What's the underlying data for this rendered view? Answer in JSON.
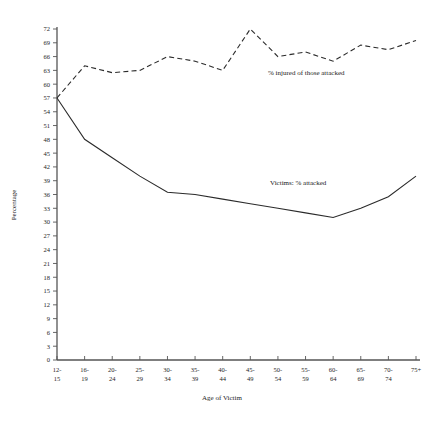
{
  "chart_data": {
    "type": "line",
    "title": "",
    "xlabel": "Age of Victim",
    "ylabel": "Percentage",
    "categories": [
      "12-\n15",
      "16-\n19",
      "20-\n24",
      "25-\n29",
      "30-\n34",
      "35-\n39",
      "40-\n44",
      "45-\n49",
      "50-\n54",
      "55-\n59",
      "60-\n64",
      "65-\n69",
      "70-\n74",
      "75+"
    ],
    "category_labels_top": [
      "12-",
      "16-",
      "20-",
      "25-",
      "30-",
      "35-",
      "40-",
      "45-",
      "50-",
      "55-",
      "60-",
      "65-",
      "70-",
      "75+"
    ],
    "category_labels_bottom": [
      "15",
      "19",
      "24",
      "29",
      "34",
      "39",
      "44",
      "49",
      "54",
      "59",
      "64",
      "69",
      "74",
      ""
    ],
    "ylim": [
      0,
      72
    ],
    "yticks": [
      0,
      3,
      6,
      9,
      12,
      15,
      18,
      21,
      24,
      27,
      30,
      33,
      36,
      39,
      42,
      45,
      48,
      51,
      54,
      57,
      60,
      63,
      66,
      69,
      72
    ],
    "grid": false,
    "legend_position": "inline-annotation",
    "series": [
      {
        "name": "Victims: % attacked",
        "style": "solid",
        "label_text": "Victims: % attacked",
        "values": [
          57,
          48,
          44,
          40,
          36.5,
          36,
          35,
          34,
          33,
          32,
          31,
          33,
          35.5,
          40
        ]
      },
      {
        "name": "% injured of those attacked",
        "style": "dashed",
        "label_text": "% injured of those attacked",
        "values": [
          57,
          64,
          62.5,
          63,
          66,
          65,
          63,
          72,
          66,
          67,
          65,
          68.5,
          67.5,
          69.5
        ]
      }
    ]
  },
  "annotations": {
    "injured_label": "% injured of those attacked",
    "attacked_label": "Victims: % attacked"
  }
}
